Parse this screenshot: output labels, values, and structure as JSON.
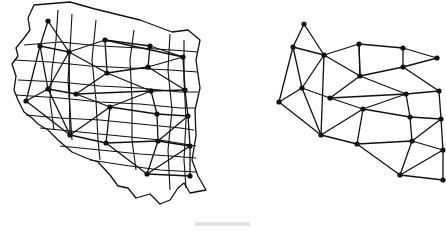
{
  "figure": {
    "left_panel": {
      "name": "map-with-network",
      "outline": "M34,5 L70,2 L95,9 L140,20 L172,32 L188,30 L200,40 L196,60 L200,88 L195,110 L196,136 L192,160 L198,176 L206,190 L190,193 L184,183 L178,188 L170,200 L160,204 L150,194 L136,198 L128,188 L118,186 L110,175 L98,162 L86,158 L72,152 L58,140 L48,130 L38,124 L32,118 L24,112 L18,100 L14,90 L16,76 L12,64 L18,56 L16,48 L24,38 L30,30 L28,18 L34,5 Z",
      "grid_lines": [
        "M24,45 L60,42 L100,46 L140,48 L172,50 L198,52",
        "M14,60 L50,62 L90,66 L130,68 L170,70 L198,72",
        "M18,80 L60,82 L100,86 L140,88 L180,92 L198,92",
        "M16,95 L60,98 L100,102 L140,104 L180,108 L196,108",
        "M26,115 L60,118 L100,120 L140,124 L180,128 L194,130",
        "M40,128 L80,132 L120,136 L160,140 L196,146",
        "M60,146 L100,150 L140,154 L170,156 L196,158",
        "M90,160 L130,166 L160,170 L196,172",
        "M58,10 L56,40 L52,70 L50,100 L54,130",
        "M72,14 L70,50 L68,80 L70,110 L72,140",
        "M96,20 L92,60 L96,100 L98,140 L100,160",
        "M134,30 L130,60 L132,100 L132,140 L136,170",
        "M170,34 L168,70 L172,110 L168,150 L170,190",
        "M184,40 L184,80 L186,120 L184,160 L186,188"
      ],
      "nodes": [
        [
          48,
          21
        ],
        [
          40,
          46
        ],
        [
          69,
          52
        ],
        [
          105,
          40
        ],
        [
          150,
          46
        ],
        [
          183,
          57
        ],
        [
          107,
          73
        ],
        [
          148,
          67
        ],
        [
          48,
          89
        ],
        [
          76,
          94
        ],
        [
          151,
          91
        ],
        [
          185,
          90
        ],
        [
          26,
          101
        ],
        [
          110,
          107
        ],
        [
          157,
          114
        ],
        [
          188,
          116
        ],
        [
          70,
          135
        ],
        [
          106,
          143
        ],
        [
          158,
          141
        ],
        [
          190,
          146
        ],
        [
          147,
          174
        ],
        [
          190,
          176
        ]
      ],
      "edges": [
        [
          0,
          1
        ],
        [
          0,
          2
        ],
        [
          1,
          2
        ],
        [
          1,
          8
        ],
        [
          1,
          12
        ],
        [
          2,
          3
        ],
        [
          2,
          6
        ],
        [
          2,
          8
        ],
        [
          3,
          4
        ],
        [
          3,
          6
        ],
        [
          4,
          5
        ],
        [
          4,
          7
        ],
        [
          5,
          7
        ],
        [
          6,
          7
        ],
        [
          6,
          9
        ],
        [
          6,
          10
        ],
        [
          7,
          11
        ],
        [
          8,
          9
        ],
        [
          8,
          12
        ],
        [
          8,
          16
        ],
        [
          9,
          10
        ],
        [
          9,
          13
        ],
        [
          10,
          11
        ],
        [
          10,
          13
        ],
        [
          10,
          14
        ],
        [
          11,
          15
        ],
        [
          12,
          16
        ],
        [
          13,
          14
        ],
        [
          13,
          16
        ],
        [
          13,
          17
        ],
        [
          14,
          15
        ],
        [
          14,
          18
        ],
        [
          15,
          18
        ],
        [
          15,
          19
        ],
        [
          16,
          17
        ],
        [
          17,
          18
        ],
        [
          17,
          20
        ],
        [
          18,
          19
        ],
        [
          18,
          20
        ],
        [
          19,
          20
        ],
        [
          19,
          21
        ],
        [
          20,
          21
        ],
        [
          2,
          16
        ],
        [
          3,
          5
        ],
        [
          5,
          11
        ]
      ]
    },
    "right_panel": {
      "name": "extracted-network",
      "nodes": [
        [
          304,
          24
        ],
        [
          293,
          47
        ],
        [
          324,
          55
        ],
        [
          359,
          44
        ],
        [
          403,
          48
        ],
        [
          437,
          58
        ],
        [
          360,
          76
        ],
        [
          403,
          67
        ],
        [
          302,
          88
        ],
        [
          330,
          98
        ],
        [
          406,
          94
        ],
        [
          439,
          91
        ],
        [
          279,
          102
        ],
        [
          363,
          109
        ],
        [
          410,
          117
        ],
        [
          441,
          119
        ],
        [
          321,
          135
        ],
        [
          357,
          144
        ],
        [
          412,
          141
        ],
        [
          443,
          150
        ],
        [
          400,
          175
        ],
        [
          443,
          180
        ]
      ],
      "edges": [
        [
          0,
          1
        ],
        [
          0,
          2
        ],
        [
          1,
          2
        ],
        [
          1,
          8
        ],
        [
          1,
          12
        ],
        [
          2,
          3
        ],
        [
          2,
          6
        ],
        [
          2,
          8
        ],
        [
          3,
          4
        ],
        [
          3,
          6
        ],
        [
          4,
          5
        ],
        [
          4,
          7
        ],
        [
          5,
          7
        ],
        [
          6,
          7
        ],
        [
          6,
          9
        ],
        [
          6,
          10
        ],
        [
          7,
          11
        ],
        [
          8,
          9
        ],
        [
          8,
          12
        ],
        [
          8,
          16
        ],
        [
          9,
          10
        ],
        [
          9,
          13
        ],
        [
          10,
          11
        ],
        [
          10,
          13
        ],
        [
          10,
          14
        ],
        [
          11,
          15
        ],
        [
          12,
          16
        ],
        [
          13,
          14
        ],
        [
          13,
          16
        ],
        [
          13,
          17
        ],
        [
          14,
          15
        ],
        [
          14,
          18
        ],
        [
          15,
          18
        ],
        [
          15,
          19
        ],
        [
          16,
          17
        ],
        [
          17,
          18
        ],
        [
          17,
          20
        ],
        [
          18,
          19
        ],
        [
          18,
          20
        ],
        [
          19,
          20
        ],
        [
          19,
          21
        ],
        [
          20,
          21
        ],
        [
          2,
          16
        ],
        [
          3,
          6
        ]
      ]
    },
    "colors": {
      "ink": "#111111",
      "background": "#ffffff"
    }
  }
}
